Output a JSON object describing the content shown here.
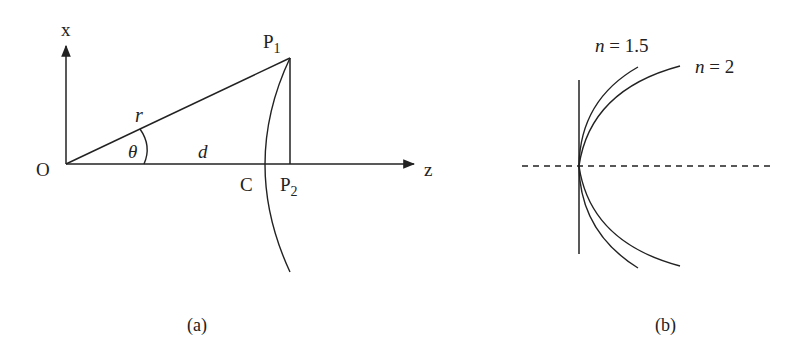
{
  "panel_a": {
    "caption": "(a)",
    "axis_x_label": "x",
    "axis_z_label": "z",
    "origin_label": "O",
    "point_p1_label": "P",
    "point_p1_sub": "1",
    "point_p2_label": "P",
    "point_p2_sub": "2",
    "point_c_label": "C",
    "radius_label": "r",
    "angle_label": "θ",
    "distance_label": "d"
  },
  "panel_b": {
    "caption": "(b)",
    "curves": [
      {
        "label_n": "n",
        "label_eq": " = 1.5"
      },
      {
        "label_n": "n",
        "label_eq": " = 2"
      }
    ]
  },
  "colors": {
    "stroke": "#222222",
    "background": "#ffffff"
  }
}
